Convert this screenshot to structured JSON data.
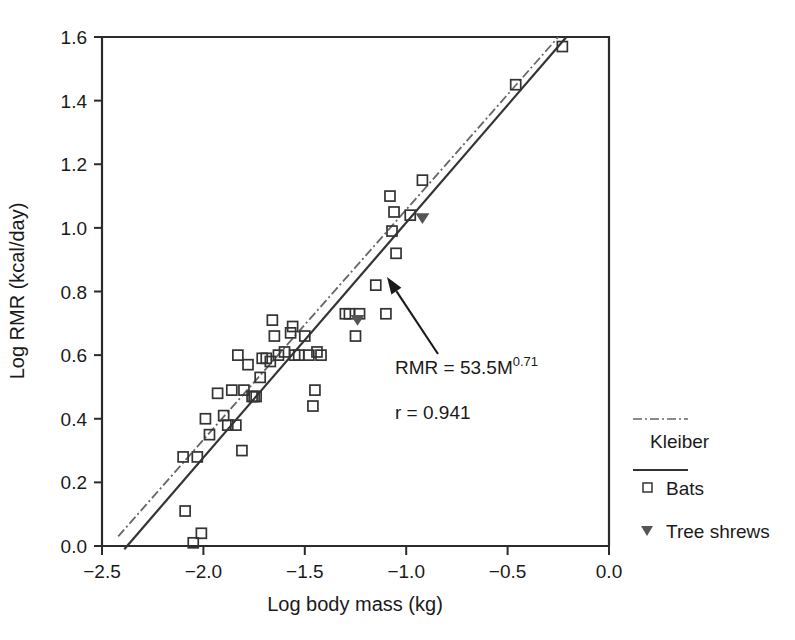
{
  "chart_data": {
    "type": "scatter",
    "title": "",
    "xlabel": "Log body mass (kg)",
    "ylabel": "Log RMR (kcal/day)",
    "xlim": [
      -2.5,
      0.0
    ],
    "ylim": [
      0.0,
      1.6
    ],
    "xticks": [
      -2.5,
      -2.0,
      -1.5,
      -1.0,
      -0.5,
      0.0
    ],
    "xticklabels": [
      "−2.5",
      "−2.0",
      "−1.5",
      "−1.0",
      "−0.5",
      "0.0"
    ],
    "yticks": [
      0.0,
      0.2,
      0.4,
      0.6,
      0.8,
      1.0,
      1.2,
      1.4,
      1.6
    ],
    "yticklabels": [
      "0.0",
      "0.2",
      "0.4",
      "0.6",
      "0.8",
      "1.0",
      "1.2",
      "1.4",
      "1.6"
    ],
    "grid": false,
    "legend_position": "right-outside",
    "series": [
      {
        "name": "Bats",
        "marker": "open-square",
        "color": "#333333",
        "points": [
          [
            -2.09,
            0.11
          ],
          [
            -2.01,
            0.04
          ],
          [
            -2.05,
            0.01
          ],
          [
            -2.1,
            0.28
          ],
          [
            -2.03,
            0.28
          ],
          [
            -1.97,
            0.35
          ],
          [
            -1.99,
            0.4
          ],
          [
            -1.93,
            0.48
          ],
          [
            -1.9,
            0.41
          ],
          [
            -1.88,
            0.38
          ],
          [
            -1.84,
            0.38
          ],
          [
            -1.86,
            0.49
          ],
          [
            -1.81,
            0.3
          ],
          [
            -1.83,
            0.6
          ],
          [
            -1.8,
            0.49
          ],
          [
            -1.78,
            0.57
          ],
          [
            -1.76,
            0.47
          ],
          [
            -1.75,
            0.47
          ],
          [
            -1.74,
            0.47
          ],
          [
            -1.72,
            0.53
          ],
          [
            -1.71,
            0.59
          ],
          [
            -1.69,
            0.59
          ],
          [
            -1.67,
            0.58
          ],
          [
            -1.66,
            0.71
          ],
          [
            -1.65,
            0.66
          ],
          [
            -1.63,
            0.6
          ],
          [
            -1.6,
            0.61
          ],
          [
            -1.57,
            0.67
          ],
          [
            -1.56,
            0.69
          ],
          [
            -1.55,
            0.6
          ],
          [
            -1.53,
            0.6
          ],
          [
            -1.5,
            0.66
          ],
          [
            -1.48,
            0.6
          ],
          [
            -1.45,
            0.49
          ],
          [
            -1.46,
            0.44
          ],
          [
            -1.44,
            0.61
          ],
          [
            -1.42,
            0.6
          ],
          [
            -1.3,
            0.73
          ],
          [
            -1.28,
            0.73
          ],
          [
            -1.25,
            0.66
          ],
          [
            -1.23,
            0.73
          ],
          [
            -1.15,
            0.82
          ],
          [
            -1.1,
            0.73
          ],
          [
            -1.08,
            1.1
          ],
          [
            -1.06,
            1.05
          ],
          [
            -1.07,
            0.99
          ],
          [
            -1.05,
            0.92
          ],
          [
            -0.98,
            1.04
          ],
          [
            -0.92,
            1.15
          ],
          [
            -0.46,
            1.45
          ],
          [
            -0.23,
            1.57
          ]
        ]
      },
      {
        "name": "Tree shrews",
        "marker": "filled-triangle-down",
        "color": "#555555",
        "points": [
          [
            -1.24,
            0.71
          ],
          [
            -0.92,
            1.03
          ]
        ]
      }
    ],
    "lines": [
      {
        "name": "Kleiber",
        "style": "dash-dot",
        "color": "#666666",
        "x0": -2.42,
        "y0": 0.03,
        "x1": -0.25,
        "y1": 1.6
      },
      {
        "name": "Bats regression",
        "style": "solid",
        "color": "#333333",
        "x0": -2.39,
        "y0": -0.01,
        "x1": -0.21,
        "y1": 1.6
      }
    ],
    "annotations": [
      {
        "name": "equation",
        "text_main": "RMR = 53.5M",
        "text_sup": "0.71",
        "x": 395,
        "y": 374
      },
      {
        "name": "correlation",
        "text_main": "r = 0.941",
        "text_sup": "",
        "x": 395,
        "y": 419
      }
    ],
    "arrow": {
      "tail_x": 438,
      "tail_y": 354,
      "tip_x": 387,
      "tip_y": 277
    }
  },
  "legend": {
    "items": [
      {
        "label": "Kleiber",
        "marker": "dash-dot-line"
      },
      {
        "label": "Bats",
        "marker": "solid-line-with-open-square"
      },
      {
        "label": "Tree shrews",
        "marker": "filled-triangle-down"
      }
    ]
  },
  "axes": {
    "x_title": "Log body mass (kg)",
    "y_title": "Log RMR (kcal/day)"
  }
}
